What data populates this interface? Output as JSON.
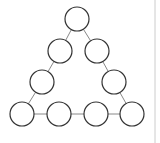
{
  "diagram": {
    "type": "triangle-of-circles",
    "stroke_color": "#333333",
    "line_color": "#888888",
    "border_color": "#cccccc",
    "radius": 12,
    "nodes": [
      {
        "id": "top",
        "cx": 77,
        "cy": 19
      },
      {
        "id": "left-2",
        "cx": 60,
        "cy": 51
      },
      {
        "id": "right-2",
        "cx": 97,
        "cy": 51
      },
      {
        "id": "left-3",
        "cx": 42,
        "cy": 82
      },
      {
        "id": "right-3",
        "cx": 114,
        "cy": 82
      },
      {
        "id": "bottom-1",
        "cx": 22,
        "cy": 114
      },
      {
        "id": "bottom-2",
        "cx": 59,
        "cy": 114
      },
      {
        "id": "bottom-3",
        "cx": 96,
        "cy": 114
      },
      {
        "id": "bottom-4",
        "cx": 132,
        "cy": 114
      }
    ],
    "edges": [
      [
        "top",
        "left-2"
      ],
      [
        "top",
        "right-2"
      ],
      [
        "left-2",
        "left-3"
      ],
      [
        "right-2",
        "right-3"
      ],
      [
        "left-3",
        "bottom-1"
      ],
      [
        "right-3",
        "bottom-4"
      ],
      [
        "bottom-1",
        "bottom-2"
      ],
      [
        "bottom-2",
        "bottom-3"
      ],
      [
        "bottom-3",
        "bottom-4"
      ]
    ]
  }
}
